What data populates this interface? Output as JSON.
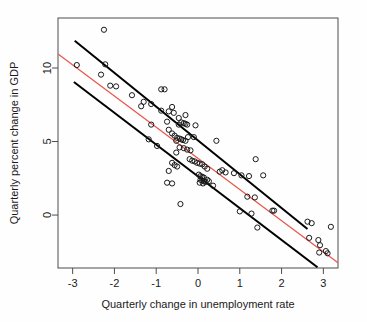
{
  "chart_data": {
    "type": "scatter",
    "title": "",
    "xlabel": "Quarterly change in unemployment rate",
    "ylabel": "Quarterly percent change in GDP",
    "xticks": [
      -3,
      -2,
      -1,
      0,
      1,
      2,
      3
    ],
    "xtick_labels": [
      "-3",
      "-2",
      "-1",
      "0",
      "1",
      "2",
      "3"
    ],
    "yticks": [
      0,
      5,
      10
    ],
    "ytick_labels": [
      "0",
      "5",
      "10"
    ],
    "xlim": [
      -3.35,
      3.35
    ],
    "ylim": [
      -3.6,
      13.4
    ],
    "grid": false,
    "legend": null,
    "point_marker": "open-circle",
    "point_color": "#1a1a1a",
    "colors": {
      "regression_line": "#e8554a",
      "bound_line": "#000000",
      "axis": "#4d4d4d",
      "point": "#1a1a1a",
      "background": "#ffffff"
    },
    "lines": [
      {
        "name": "regression-line",
        "style": "solid",
        "color": "#e8554a",
        "width": 1.3,
        "x": [
          -3.35,
          3.35
        ],
        "y": [
          10.95,
          -3.25
        ]
      },
      {
        "name": "upper-bound-line",
        "style": "solid",
        "color": "#000000",
        "width": 2.0,
        "x": [
          -2.95,
          2.62
        ],
        "y": [
          11.85,
          -0.95
        ]
      },
      {
        "name": "lower-bound-line",
        "style": "solid",
        "color": "#000000",
        "width": 2.0,
        "x": [
          -2.97,
          2.86
        ],
        "y": [
          9.05,
          -3.55
        ]
      }
    ],
    "points": [
      {
        "x": -2.25,
        "y": 12.6
      },
      {
        "x": -2.9,
        "y": 10.2
      },
      {
        "x": -2.22,
        "y": 10.25
      },
      {
        "x": -2.32,
        "y": 9.55
      },
      {
        "x": -2.1,
        "y": 8.8
      },
      {
        "x": -1.96,
        "y": 8.75
      },
      {
        "x": -1.58,
        "y": 8.15
      },
      {
        "x": -1.36,
        "y": 7.4
      },
      {
        "x": -0.88,
        "y": 8.55
      },
      {
        "x": -0.8,
        "y": 8.55
      },
      {
        "x": -1.3,
        "y": 7.7
      },
      {
        "x": -1.12,
        "y": 7.55
      },
      {
        "x": -0.88,
        "y": 7.1
      },
      {
        "x": -0.7,
        "y": 7.05
      },
      {
        "x": -0.62,
        "y": 7.35
      },
      {
        "x": -0.58,
        "y": 6.95
      },
      {
        "x": -0.46,
        "y": 6.6
      },
      {
        "x": -0.3,
        "y": 6.8
      },
      {
        "x": -0.4,
        "y": 6.3
      },
      {
        "x": -0.34,
        "y": 6.25
      },
      {
        "x": -0.3,
        "y": 6.2
      },
      {
        "x": -0.26,
        "y": 6.15
      },
      {
        "x": -1.12,
        "y": 6.15
      },
      {
        "x": -1.18,
        "y": 5.15
      },
      {
        "x": -0.98,
        "y": 4.7
      },
      {
        "x": -0.74,
        "y": 6.35
      },
      {
        "x": -0.7,
        "y": 5.8
      },
      {
        "x": -0.62,
        "y": 5.55
      },
      {
        "x": -0.56,
        "y": 5.4
      },
      {
        "x": -0.5,
        "y": 5.25
      },
      {
        "x": -0.44,
        "y": 5.2
      },
      {
        "x": -0.4,
        "y": 5.15
      },
      {
        "x": -0.36,
        "y": 5.1
      },
      {
        "x": -0.3,
        "y": 5.05
      },
      {
        "x": -0.24,
        "y": 5.3
      },
      {
        "x": -0.1,
        "y": 5.3
      },
      {
        "x": -0.52,
        "y": 4.25
      },
      {
        "x": -0.44,
        "y": 4.6
      },
      {
        "x": -0.34,
        "y": 4.55
      },
      {
        "x": -0.26,
        "y": 4.45
      },
      {
        "x": -0.18,
        "y": 4.4
      },
      {
        "x": -0.62,
        "y": 3.55
      },
      {
        "x": -0.56,
        "y": 3.4
      },
      {
        "x": -0.5,
        "y": 3.3
      },
      {
        "x": -0.7,
        "y": 3.0
      },
      {
        "x": -0.2,
        "y": 3.8
      },
      {
        "x": -0.14,
        "y": 3.7
      },
      {
        "x": -0.08,
        "y": 3.65
      },
      {
        "x": -0.02,
        "y": 3.55
      },
      {
        "x": 0.04,
        "y": 3.5
      },
      {
        "x": 0.1,
        "y": 3.45
      },
      {
        "x": 0.16,
        "y": 3.3
      },
      {
        "x": 0.22,
        "y": 3.15
      },
      {
        "x": -0.74,
        "y": 2.2
      },
      {
        "x": -0.62,
        "y": 2.15
      },
      {
        "x": -0.42,
        "y": 0.75
      },
      {
        "x": 0.02,
        "y": 2.75
      },
      {
        "x": 0.06,
        "y": 2.65
      },
      {
        "x": 0.1,
        "y": 2.6
      },
      {
        "x": 0.14,
        "y": 2.55
      },
      {
        "x": 0.06,
        "y": 2.4
      },
      {
        "x": 0.1,
        "y": 2.35
      },
      {
        "x": 0.14,
        "y": 2.3
      },
      {
        "x": 0.18,
        "y": 2.25
      },
      {
        "x": 0.22,
        "y": 2.4
      },
      {
        "x": 0.26,
        "y": 2.3
      },
      {
        "x": 0.04,
        "y": 2.2
      },
      {
        "x": 0.12,
        "y": 2.15
      },
      {
        "x": 0.36,
        "y": 2.0
      },
      {
        "x": 0.52,
        "y": 2.95
      },
      {
        "x": 0.58,
        "y": 3.05
      },
      {
        "x": 0.66,
        "y": 2.9
      },
      {
        "x": 0.86,
        "y": 2.85
      },
      {
        "x": 1.04,
        "y": 2.7
      },
      {
        "x": 1.22,
        "y": 2.65
      },
      {
        "x": 1.38,
        "y": 3.8
      },
      {
        "x": 1.56,
        "y": 2.7
      },
      {
        "x": 1.0,
        "y": 0.25
      },
      {
        "x": 1.18,
        "y": 1.25
      },
      {
        "x": 1.36,
        "y": 1.2
      },
      {
        "x": 1.28,
        "y": 0.1
      },
      {
        "x": 1.42,
        "y": -0.85
      },
      {
        "x": 1.78,
        "y": 0.3
      },
      {
        "x": 1.82,
        "y": 0.3
      },
      {
        "x": 2.62,
        "y": -0.45
      },
      {
        "x": 2.72,
        "y": -0.55
      },
      {
        "x": 2.66,
        "y": -1.55
      },
      {
        "x": 2.88,
        "y": -1.7
      },
      {
        "x": 2.92,
        "y": -2.05
      },
      {
        "x": 2.9,
        "y": -2.55
      },
      {
        "x": 3.06,
        "y": -2.45
      },
      {
        "x": 3.1,
        "y": -2.6
      },
      {
        "x": 3.18,
        "y": -0.8
      },
      {
        "x": 0.44,
        "y": 5.05
      },
      {
        "x": -0.06,
        "y": 6.1
      },
      {
        "x": -0.46,
        "y": 6.15
      },
      {
        "x": -0.52,
        "y": 5.05
      }
    ]
  },
  "axes": {
    "x_axis_name": "x-axis",
    "y_axis_name": "y-axis"
  }
}
